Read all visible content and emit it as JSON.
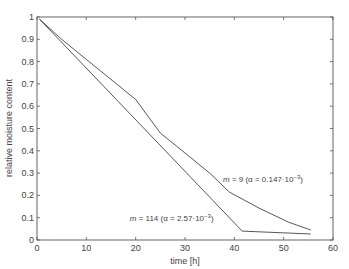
{
  "chart_data": {
    "type": "line",
    "title": "",
    "xlabel": "time [h]",
    "ylabel": "relative moisture content",
    "xlim": [
      0,
      60
    ],
    "ylim": [
      0,
      1
    ],
    "xticks": [
      0,
      10,
      20,
      30,
      40,
      50,
      60
    ],
    "yticks": [
      0,
      0.1,
      0.2,
      0.3,
      0.4,
      0.5,
      0.6,
      0.7,
      0.8,
      0.9,
      1
    ],
    "ytick_labels": [
      "0",
      "0.1",
      "0.2",
      "0.3",
      "0.4",
      "0.5",
      "0.6",
      "0.7",
      "0.8",
      "0.9",
      "1"
    ],
    "grid": false,
    "legend": null,
    "series": [
      {
        "name": "m = 9 (α = 0.147·10⁻³)",
        "x": [
          0.5,
          5,
          10,
          15,
          20,
          25,
          30,
          35,
          39,
          45,
          51,
          55.5
        ],
        "y": [
          0.99,
          0.9,
          0.81,
          0.72,
          0.63,
          0.48,
          0.39,
          0.3,
          0.215,
          0.143,
          0.08,
          0.045
        ]
      },
      {
        "name": "m = 114 (α = 2.57·10⁻³)",
        "x": [
          0.5,
          41.6,
          55.5
        ],
        "y": [
          0.99,
          0.04,
          0.027
        ]
      }
    ],
    "annotations": [
      {
        "m": "m",
        "rest": " = 9 (α = 0.147·10",
        "exp": "−3",
        "close": ")",
        "x": 37.7,
        "y": 0.26
      },
      {
        "m": "m",
        "rest": " = 114 (α = 2.57·10",
        "exp": "−3",
        "close": ")",
        "x": 18.8,
        "y": 0.085
      }
    ]
  }
}
